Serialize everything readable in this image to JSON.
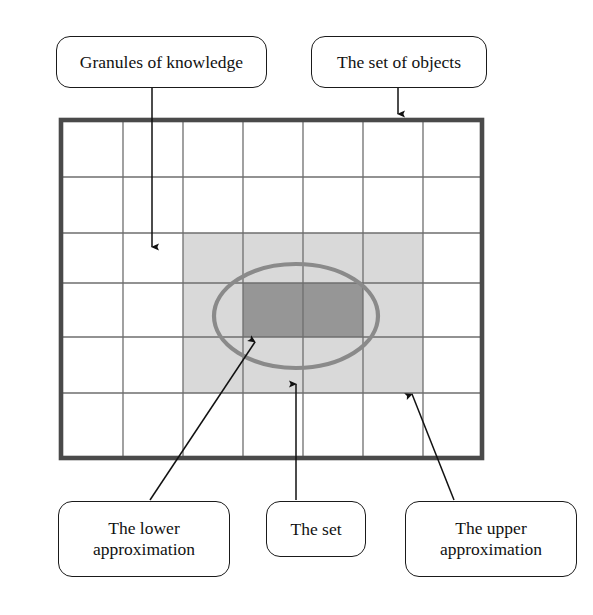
{
  "diagram": {
    "canvas": {
      "width": 593,
      "height": 615,
      "background": "#ffffff"
    },
    "colors": {
      "outer_border": "#4a4a4a",
      "grid_line": "#6e6e6e",
      "upper_approximation_fill": "#d8d8d8",
      "lower_approximation_fill": "#969696",
      "ellipse_stroke": "#8a8a8a",
      "label_border": "#1a1a1a",
      "label_text": "#111111",
      "connector": "#111111"
    },
    "universe_grid": {
      "name": "the-set-of-objects-grid",
      "x": 61,
      "y": 120,
      "width": 421,
      "height": 338,
      "columns": 7,
      "rows": 6,
      "column_edges": [
        61,
        123,
        183,
        243,
        303,
        363,
        423,
        482
      ],
      "row_edges": [
        120,
        177,
        233,
        283,
        337,
        393,
        458
      ],
      "border_width": 4.5,
      "grid_line_width": 1.2
    },
    "upper_approximation_region": {
      "name": "upper-approximation-region",
      "x": 183,
      "y": 233,
      "width": 240,
      "height": 160,
      "cells_wide": 4,
      "cells_tall": 3
    },
    "lower_approximation_region": {
      "name": "lower-approximation-region",
      "x": 243,
      "y": 283,
      "width": 120,
      "height": 54,
      "cells_wide": 2,
      "cells_tall": 1
    },
    "set_ellipse": {
      "name": "the-set-ellipse",
      "cx": 296,
      "cy": 316,
      "rx": 82,
      "ry": 52,
      "stroke_width": 4
    }
  },
  "labels": {
    "granules": {
      "id": "granules-of-knowledge",
      "text": "Granules of knowledge"
    },
    "objects": {
      "id": "the-set-of-objects",
      "text": "The set of objects"
    },
    "lower": {
      "id": "the-lower-approximation",
      "text": "The lower\napproximation"
    },
    "set": {
      "id": "the-set",
      "text": "The set"
    },
    "upper": {
      "id": "the-upper-approximation",
      "text": "The upper\napproximation"
    }
  },
  "connectors": [
    {
      "name": "connector-granules",
      "from_label": "granules",
      "points": "152,88 152,250",
      "arrow_at": {
        "x": 152,
        "y": 253
      },
      "arrow_direction": "down"
    },
    {
      "name": "connector-objects",
      "from_label": "objects",
      "points": "398,88 398,116",
      "arrow_at": {
        "x": 398,
        "y": 120
      },
      "arrow_direction": "down"
    },
    {
      "name": "connector-lower",
      "from_label": "lower",
      "points": "150,500 253,340",
      "arrow_at": {
        "x": 250,
        "y": 336
      },
      "arrow_direction": "up-right"
    },
    {
      "name": "connector-set",
      "from_label": "set",
      "points": "296,500 296,382",
      "arrow_at": {
        "x": 296,
        "y": 378
      },
      "arrow_direction": "up"
    },
    {
      "name": "connector-upper",
      "from_label": "upper",
      "points": "454,500 412,392",
      "arrow_at": {
        "x": 410,
        "y": 388
      },
      "arrow_direction": "up-left"
    }
  ]
}
